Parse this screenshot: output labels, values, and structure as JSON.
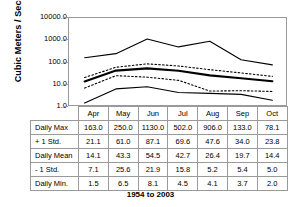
{
  "chart_data": {
    "type": "line",
    "title": "",
    "xlabel": "",
    "ylabel": "Cubic Meters / Second",
    "caption": "1954 to 2003",
    "yscale": "log",
    "ylim": [
      1.0,
      10000.0
    ],
    "ytick_labels": [
      "10000.0",
      "1000.0",
      "100.0",
      "10.0",
      "1.0"
    ],
    "ytick_values": [
      10000.0,
      1000.0,
      100.0,
      10.0,
      1.0
    ],
    "grid": false,
    "legend": "none",
    "categories": [
      "Apr",
      "May",
      "Jun",
      "Jul",
      "Aug",
      "Sep",
      "Oct"
    ],
    "series": [
      {
        "name": "Daily Max",
        "style": "solid",
        "width": "thin",
        "values": [
          163.0,
          250.0,
          1130.0,
          502.0,
          906.0,
          133.0,
          78.1
        ]
      },
      {
        "name": "+ 1 Std.",
        "style": "dotted",
        "width": "thin",
        "values": [
          21.1,
          61.0,
          87.1,
          69.6,
          47.6,
          34.0,
          23.8
        ]
      },
      {
        "name": "Daily Mean",
        "style": "solid",
        "width": "thick",
        "values": [
          14.1,
          43.3,
          54.5,
          42.7,
          26.4,
          19.7,
          14.4
        ]
      },
      {
        "name": "- 1 Std.",
        "style": "dotted",
        "width": "thin",
        "values": [
          7.1,
          25.6,
          21.9,
          15.8,
          5.2,
          5.4,
          5.0
        ]
      },
      {
        "name": "Daily Min.",
        "style": "solid",
        "width": "thin",
        "values": [
          1.5,
          6.5,
          8.1,
          4.5,
          4.1,
          3.7,
          2.0
        ]
      }
    ]
  },
  "table": {
    "corner_label": "",
    "column_headers": [
      "Apr",
      "May",
      "Jun",
      "Jul",
      "Aug",
      "Sep",
      "Oct"
    ],
    "rows": [
      {
        "label": "Daily Max",
        "cells": [
          "163.0",
          "250.0",
          "1130.0",
          "502.0",
          "906.0",
          "133.0",
          "78.1"
        ]
      },
      {
        "label": "+ 1 Std.",
        "cells": [
          "21.1",
          "61.0",
          "87.1",
          "69.6",
          "47.6",
          "34.0",
          "23.8"
        ]
      },
      {
        "label": "Daily Mean",
        "cells": [
          "14.1",
          "43.3",
          "54.5",
          "42.7",
          "26.4",
          "19.7",
          "14.4"
        ]
      },
      {
        "label": "- 1 Std.",
        "cells": [
          "7.1",
          "25.6",
          "21.9",
          "15.8",
          "5.2",
          "5.4",
          "5.0"
        ]
      },
      {
        "label": "Daily Min.",
        "cells": [
          "1.5",
          "6.5",
          "8.1",
          "4.5",
          "4.1",
          "3.7",
          "2.0"
        ]
      }
    ]
  },
  "colors": {
    "line": "#000000",
    "frame": "#9a9a9a",
    "background": "#ffffff"
  }
}
